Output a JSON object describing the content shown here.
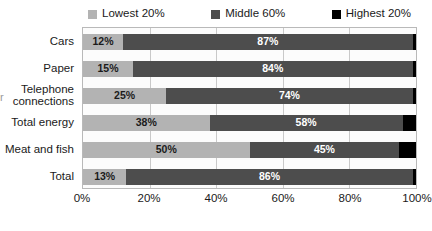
{
  "chart_data": {
    "type": "bar",
    "subtype": "stacked-horizontal-100",
    "title": "",
    "subtitle": "",
    "xlabel": "",
    "ylabel": "",
    "xlim": [
      0,
      100
    ],
    "grid": true,
    "legend_position": "top",
    "categories": [
      "Cars",
      "Paper",
      "Telephone\nconnections",
      "Total energy",
      "Meat and fish",
      "Total"
    ],
    "xticks": [
      "0%",
      "20%",
      "40%",
      "60%",
      "80%",
      "100%"
    ],
    "xtick_values": [
      0,
      20,
      40,
      60,
      80,
      100
    ],
    "series": [
      {
        "name": "Lowest 20%",
        "color": "#b3b3b3",
        "values": [
          12,
          15,
          25,
          38,
          50,
          13
        ],
        "labels": [
          "12%",
          "15%",
          "25%",
          "38%",
          "50%",
          "13%"
        ]
      },
      {
        "name": "Middle 60%",
        "color": "#4d4d4d",
        "values": [
          87,
          84,
          74,
          58,
          45,
          86
        ],
        "labels": [
          "87%",
          "84%",
          "74%",
          "58%",
          "45%",
          "86%"
        ]
      },
      {
        "name": "Highest 20%",
        "color": "#000000",
        "values": [
          1,
          1,
          1,
          4,
          5,
          1
        ],
        "labels": [
          "",
          "",
          "",
          "",
          "",
          ""
        ]
      }
    ]
  },
  "legend": {
    "items": [
      {
        "label": "Lowest 20%",
        "color": "#b3b3b3"
      },
      {
        "label": "Middle 60%",
        "color": "#4d4d4d"
      },
      {
        "label": "Highest 20%",
        "color": "#000000"
      }
    ]
  },
  "categories": [
    {
      "label": "Cars"
    },
    {
      "label": "Paper"
    },
    {
      "label": "Telephone\nconnections"
    },
    {
      "label": "Total energy"
    },
    {
      "label": "Meat and fish"
    },
    {
      "label": "Total"
    }
  ],
  "xaxis": {
    "ticks": [
      {
        "label": "0%"
      },
      {
        "label": "20%"
      },
      {
        "label": "40%"
      },
      {
        "label": "60%"
      },
      {
        "label": "80%"
      },
      {
        "label": "100%"
      }
    ]
  },
  "rows": [
    {
      "category": "Cars",
      "segments": [
        {
          "series": "Lowest 20%",
          "value": 12,
          "label": "12%"
        },
        {
          "series": "Middle 60%",
          "value": 87,
          "label": "87%"
        },
        {
          "series": "Highest 20%",
          "value": 1,
          "label": ""
        }
      ]
    },
    {
      "category": "Paper",
      "segments": [
        {
          "series": "Lowest 20%",
          "value": 15,
          "label": "15%"
        },
        {
          "series": "Middle 60%",
          "value": 84,
          "label": "84%"
        },
        {
          "series": "Highest 20%",
          "value": 1,
          "label": ""
        }
      ]
    },
    {
      "category": "Telephone connections",
      "segments": [
        {
          "series": "Lowest 20%",
          "value": 25,
          "label": "25%"
        },
        {
          "series": "Middle 60%",
          "value": 74,
          "label": "74%"
        },
        {
          "series": "Highest 20%",
          "value": 1,
          "label": ""
        }
      ]
    },
    {
      "category": "Total energy",
      "segments": [
        {
          "series": "Lowest 20%",
          "value": 38,
          "label": "38%"
        },
        {
          "series": "Middle 60%",
          "value": 58,
          "label": "58%"
        },
        {
          "series": "Highest 20%",
          "value": 4,
          "label": ""
        }
      ]
    },
    {
      "category": "Meat and fish",
      "segments": [
        {
          "series": "Lowest 20%",
          "value": 50,
          "label": "50%"
        },
        {
          "series": "Middle 60%",
          "value": 45,
          "label": "45%"
        },
        {
          "series": "Highest 20%",
          "value": 5,
          "label": ""
        }
      ]
    },
    {
      "category": "Total",
      "segments": [
        {
          "series": "Lowest 20%",
          "value": 13,
          "label": "13%"
        },
        {
          "series": "Middle 60%",
          "value": 86,
          "label": "86%"
        },
        {
          "series": "Highest 20%",
          "value": 1,
          "label": ""
        }
      ]
    }
  ],
  "artifact": {
    "text": "r"
  }
}
